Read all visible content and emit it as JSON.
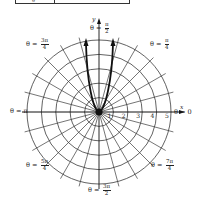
{
  "table_fragment": {
    "first_cell_glyph": "θ"
  },
  "graph": {
    "center": [
      99,
      112
    ],
    "unit_px": 14.4,
    "max_radius_units": 5,
    "radial_step_deg": 15,
    "grid_color": "#3a3a3a",
    "curve_color": "#111111",
    "axes": {
      "x_label": "x",
      "y_label": "y"
    },
    "ticks": [
      "1",
      "2",
      "3",
      "4",
      "5"
    ],
    "angle_labels": [
      {
        "id": "theta-0",
        "prefix": "θ = ",
        "num": "0",
        "den": "",
        "x": 174,
        "y": 113
      },
      {
        "id": "theta-pi-4",
        "prefix": "θ = ",
        "num": "π",
        "den": "4",
        "x": 150,
        "y": 42
      },
      {
        "id": "theta-pi-2",
        "prefix": "θ = ",
        "num": "π",
        "den": "2",
        "x": 90,
        "y": 26
      },
      {
        "id": "theta-3pi-4",
        "prefix": "θ = ",
        "num": "3π",
        "den": "4",
        "x": 26,
        "y": 42
      },
      {
        "id": "theta-pi",
        "prefix": "θ = π",
        "num": "",
        "den": "",
        "x": 10,
        "y": 112
      },
      {
        "id": "theta-5pi-4",
        "prefix": "θ = ",
        "num": "5π",
        "den": "4",
        "x": 26,
        "y": 163
      },
      {
        "id": "theta-7pi-4",
        "prefix": "θ = ",
        "num": "7π",
        "den": "4",
        "x": 151,
        "y": 163
      },
      {
        "id": "theta-3pi-2",
        "prefix": "θ = ",
        "num": "3π",
        "den": "2",
        "x": 88,
        "y": 188
      }
    ],
    "curve": {
      "description": "U-shaped polar curve through origin with two near-vertical branches opening upward, arrows at top",
      "left_branch_top": [
        86,
        40
      ],
      "right_branch_top": [
        113,
        40
      ]
    }
  }
}
